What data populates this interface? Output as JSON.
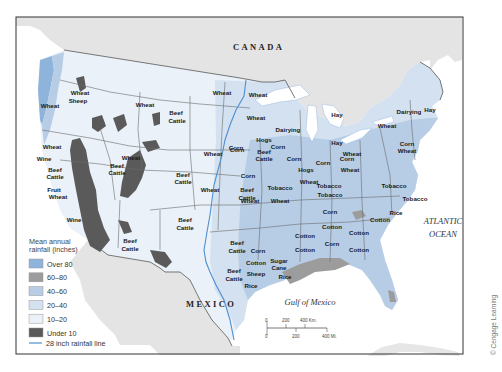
{
  "map": {
    "title_region": "United States agricultural regions and mean annual rainfall",
    "place_labels": {
      "canada": "CANADA",
      "mexico": "MEXICO",
      "atlantic_1": "ATLANTIC",
      "atlantic_2": "OCEAN",
      "gulf": "Gulf of Mexico"
    },
    "crop_labels": [
      {
        "text": "Wheat",
        "x": 80,
        "y": 95
      },
      {
        "text": "Sheep",
        "x": 78,
        "y": 103
      },
      {
        "text": "Wheat",
        "x": 50,
        "y": 108
      },
      {
        "text": "Wheat",
        "x": 145,
        "y": 107
      },
      {
        "text": "Beef",
        "x": 176,
        "y": 115
      },
      {
        "text": "Cattle",
        "x": 177,
        "y": 123
      },
      {
        "text": "Wheat",
        "x": 222,
        "y": 95
      },
      {
        "text": "Wheat",
        "x": 258,
        "y": 97
      },
      {
        "text": "Wheat",
        "x": 256,
        "y": 120
      },
      {
        "text": "Dairying",
        "x": 288,
        "y": 132
      },
      {
        "text": "Hay",
        "x": 337,
        "y": 117
      },
      {
        "text": "Dairying",
        "x": 409,
        "y": 114
      },
      {
        "text": "Hay",
        "x": 430,
        "y": 112
      },
      {
        "text": "Wheat",
        "x": 387,
        "y": 128
      },
      {
        "text": "Corn",
        "x": 407,
        "y": 146
      },
      {
        "text": "Wheat",
        "x": 407,
        "y": 153
      },
      {
        "text": "Hay",
        "x": 337,
        "y": 145
      },
      {
        "text": "Wheat",
        "x": 352,
        "y": 156
      },
      {
        "text": "Corn",
        "x": 347,
        "y": 161
      },
      {
        "text": "Hogs",
        "x": 264,
        "y": 142
      },
      {
        "text": "Corn",
        "x": 278,
        "y": 149
      },
      {
        "text": "Beef",
        "x": 264,
        "y": 154
      },
      {
        "text": "Cattle",
        "x": 264,
        "y": 161
      },
      {
        "text": "Corn",
        "x": 236,
        "y": 150
      },
      {
        "text": "Corn",
        "x": 294,
        "y": 161
      },
      {
        "text": "Corn",
        "x": 323,
        "y": 165
      },
      {
        "text": "Hogs",
        "x": 306,
        "y": 172
      },
      {
        "text": "Wheat",
        "x": 309,
        "y": 184
      },
      {
        "text": "Wheat",
        "x": 350,
        "y": 172
      },
      {
        "text": "Wheat",
        "x": 52,
        "y": 149
      },
      {
        "text": "Wine",
        "x": 44,
        "y": 161
      },
      {
        "text": "Beef",
        "x": 55,
        "y": 172
      },
      {
        "text": "Cattle",
        "x": 55,
        "y": 179
      },
      {
        "text": "Wheat",
        "x": 131,
        "y": 160
      },
      {
        "text": "Beef",
        "x": 117,
        "y": 168
      },
      {
        "text": "Cattle",
        "x": 117,
        "y": 175
      },
      {
        "text": "Beef",
        "x": 183,
        "y": 177
      },
      {
        "text": "Cattle",
        "x": 183,
        "y": 184
      },
      {
        "text": "Wheat",
        "x": 213,
        "y": 156
      },
      {
        "text": "Corn",
        "x": 237,
        "y": 152
      },
      {
        "text": "Fruit",
        "x": 54,
        "y": 192
      },
      {
        "text": "Wheat",
        "x": 58,
        "y": 199
      },
      {
        "text": "Wine",
        "x": 74,
        "y": 222
      },
      {
        "text": "Wheat",
        "x": 210,
        "y": 192
      },
      {
        "text": "Corn",
        "x": 248,
        "y": 178
      },
      {
        "text": "Beef",
        "x": 247,
        "y": 192
      },
      {
        "text": "Cattle",
        "x": 247,
        "y": 200
      },
      {
        "text": "Tobacco",
        "x": 280,
        "y": 190
      },
      {
        "text": "Wheat",
        "x": 280,
        "y": 203
      },
      {
        "text": "Tobacco",
        "x": 329,
        "y": 188
      },
      {
        "text": "Tobacco",
        "x": 394,
        "y": 188
      },
      {
        "text": "Tobacco",
        "x": 415,
        "y": 201
      },
      {
        "text": "Tobacco",
        "x": 330,
        "y": 197
      },
      {
        "text": "Wheat",
        "x": 250,
        "y": 203
      },
      {
        "text": "Corn",
        "x": 330,
        "y": 214
      },
      {
        "text": "Rice",
        "x": 396,
        "y": 215
      },
      {
        "text": "Cotton",
        "x": 380,
        "y": 222
      },
      {
        "text": "Cotton",
        "x": 332,
        "y": 229
      },
      {
        "text": "Corn",
        "x": 332,
        "y": 246
      },
      {
        "text": "Cotton",
        "x": 305,
        "y": 238
      },
      {
        "text": "Cotton",
        "x": 305,
        "y": 252
      },
      {
        "text": "Cotton",
        "x": 359,
        "y": 235
      },
      {
        "text": "Cotton",
        "x": 359,
        "y": 252
      },
      {
        "text": "Beef",
        "x": 185,
        "y": 222
      },
      {
        "text": "Cattle",
        "x": 185,
        "y": 230
      },
      {
        "text": "Beef",
        "x": 130,
        "y": 243
      },
      {
        "text": "Cattle",
        "x": 130,
        "y": 251
      },
      {
        "text": "Beef",
        "x": 237,
        "y": 245
      },
      {
        "text": "Cattle",
        "x": 237,
        "y": 253
      },
      {
        "text": "Corn",
        "x": 258,
        "y": 253
      },
      {
        "text": "Cotton",
        "x": 256,
        "y": 265
      },
      {
        "text": "Sheep",
        "x": 256,
        "y": 276
      },
      {
        "text": "Rice",
        "x": 251,
        "y": 288
      },
      {
        "text": "Beef",
        "x": 234,
        "y": 273
      },
      {
        "text": "Cattle",
        "x": 234,
        "y": 281
      },
      {
        "text": "Sugar",
        "x": 279,
        "y": 263
      },
      {
        "text": "Cane",
        "x": 279,
        "y": 270
      },
      {
        "text": "Rice",
        "x": 285,
        "y": 279
      }
    ]
  },
  "legend": {
    "title_line1": "Mean annual",
    "title_line2": "rainfall (inches)",
    "items": [
      {
        "label": "Over 80",
        "color": "#8fb4dc"
      },
      {
        "label": "60–80",
        "color": "#9c9c9c"
      },
      {
        "label": "40–60",
        "color": "#b7cde6"
      },
      {
        "label": "20–40",
        "color": "#d3e1f0"
      },
      {
        "label": "10–20",
        "color": "#eaf1f8"
      },
      {
        "label": "Under 10",
        "color": "#5a5a5a"
      }
    ],
    "line_label": "28 inch rainfall line",
    "line_color": "#4f8fd0"
  },
  "scale": {
    "km_ticks": [
      "0",
      "200",
      "400 Km."
    ],
    "mi_ticks": [
      "0",
      "200",
      "400 Mi."
    ]
  },
  "credit": "© Cengage Learning",
  "colors": {
    "land_foreign": "#e3e3e3",
    "water": "#ffffff",
    "border": "#6b6b6b"
  }
}
